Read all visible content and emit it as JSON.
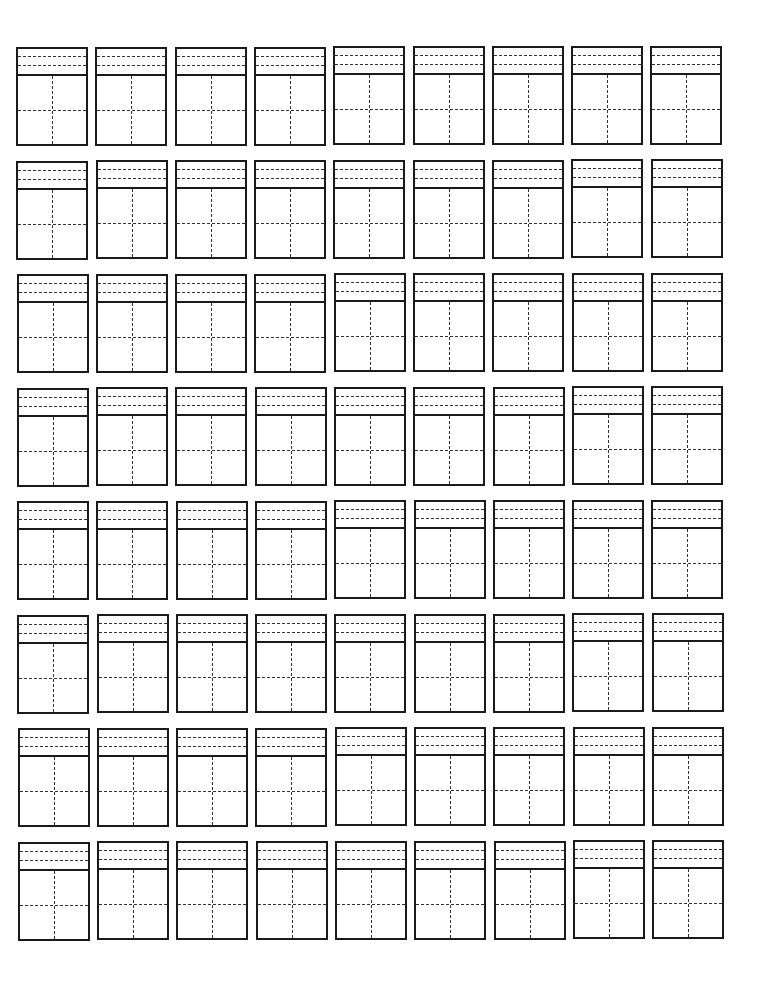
{
  "worksheet": {
    "type": "pinyin-hanzi practice grid",
    "rows": 8,
    "columns": 9,
    "cell": {
      "pinyin_guide_lines": 2,
      "character_grid": "2x2 dashed cross"
    },
    "colors": {
      "line": "#1a1a1a",
      "dashed": "#333333",
      "background": "#ffffff"
    },
    "cells_filled": []
  }
}
